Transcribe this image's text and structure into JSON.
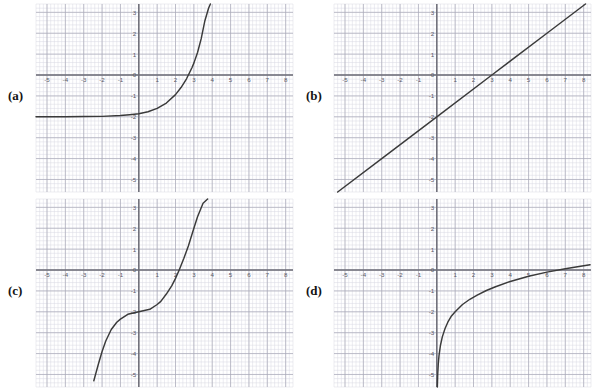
{
  "figure": {
    "background_color": "#ffffff",
    "width": 596,
    "height": 390,
    "grid_minor_color": "#d8d8e2",
    "grid_major_color": "#a9a9b8",
    "axis_color": "#6e6e78",
    "curve_color": "#3a3a3a",
    "label_color": "#141414"
  },
  "panels": [
    {
      "key": "a",
      "label": "(a)",
      "curve_type": "exponential",
      "description": "increasing exponential with horizontal asymptote y = -2, passing through (0,-2) region and crossing x-axis near x = 3"
    },
    {
      "key": "b",
      "label": "(b)",
      "curve_type": "line",
      "description": "straight line with y-intercept -2 and x-intercept 3, slope 2/3"
    },
    {
      "key": "c",
      "label": "(c)",
      "curve_type": "cubic",
      "description": "cubic with inflection point at (0,-2), flat near origin, crossing x-axis near x = 3"
    },
    {
      "key": "d",
      "label": "(d)",
      "curve_type": "logarithmic",
      "description": "logarithmic curve with vertical asymptote at x = 0, crossing x-axis near x = 2.7, reaching y = 1 near x = 8"
    }
  ],
  "axes": {
    "x_label_values": [
      "-5",
      "-4",
      "-3",
      "-2",
      "-1",
      "0",
      "1",
      "2",
      "3",
      "4",
      "5",
      "6",
      "7",
      "8"
    ],
    "y_label_values": [
      "3",
      "2",
      "1",
      "0",
      "-1",
      "-2",
      "-3",
      "-4",
      "-5"
    ],
    "x_min": -5.6,
    "x_max": 8.4,
    "y_min": -5.6,
    "y_max": 3.4,
    "minor_step": 0.2,
    "major_step": 1,
    "grid": true,
    "zero_label": "0"
  },
  "chart_data": [
    {
      "type": "line",
      "panel": "a",
      "title": "(a)",
      "xlabel": "",
      "ylabel": "",
      "xlim": [
        -5.6,
        8.4
      ],
      "ylim": [
        -5.6,
        3.4
      ],
      "grid": true,
      "legend": "none",
      "series": [
        {
          "name": "y = e^x - 2 (approx., shifted)",
          "x": [
            -5.6,
            -5.0,
            -4.0,
            -3.0,
            -2.0,
            -1.0,
            -0.5,
            0.0,
            0.5,
            1.0,
            1.5,
            2.0,
            2.3,
            2.6,
            2.9,
            3.0,
            3.2,
            3.4,
            3.6,
            3.8,
            3.9
          ],
          "y": [
            -2.0,
            -2.0,
            -2.0,
            -1.99,
            -1.98,
            -1.94,
            -1.9,
            -1.85,
            -1.76,
            -1.6,
            -1.34,
            -0.94,
            -0.6,
            -0.18,
            0.36,
            0.57,
            1.08,
            1.74,
            2.6,
            3.2,
            3.4
          ]
        }
      ]
    },
    {
      "type": "line",
      "panel": "b",
      "title": "(b)",
      "xlabel": "",
      "ylabel": "",
      "xlim": [
        -5.6,
        8.4
      ],
      "ylim": [
        -5.6,
        3.4
      ],
      "grid": true,
      "legend": "none",
      "series": [
        {
          "name": "y = (2/3)x - 2",
          "x": [
            -5.4,
            -3.0,
            0.0,
            3.0,
            6.0,
            8.1
          ],
          "y": [
            -5.6,
            -4.0,
            -2.0,
            0.0,
            2.0,
            3.4
          ]
        }
      ]
    },
    {
      "type": "line",
      "panel": "c",
      "title": "(c)",
      "xlabel": "",
      "ylabel": "",
      "xlim": [
        -5.6,
        8.4
      ],
      "ylim": [
        -5.6,
        3.4
      ],
      "grid": true,
      "legend": "none",
      "series": [
        {
          "name": "y = 0.2x^3 - 2 (approx. cubic, inflection at (0,-2))",
          "x": [
            -2.45,
            -2.2,
            -2.0,
            -1.8,
            -1.5,
            -1.2,
            -1.0,
            -0.6,
            0.0,
            0.6,
            1.0,
            1.2,
            1.5,
            1.8,
            2.0,
            2.2,
            2.45,
            2.7,
            3.0,
            3.2,
            3.5,
            3.75
          ],
          "y": [
            -5.3,
            -4.5,
            -3.9,
            -3.4,
            -2.85,
            -2.5,
            -2.35,
            -2.12,
            -2.0,
            -1.88,
            -1.65,
            -1.5,
            -1.15,
            -0.75,
            -0.4,
            0.0,
            0.55,
            1.15,
            2.0,
            2.55,
            3.2,
            3.4
          ]
        }
      ]
    },
    {
      "type": "line",
      "panel": "d",
      "title": "(d)",
      "xlabel": "",
      "ylabel": "",
      "xlim": [
        -5.6,
        8.4
      ],
      "ylim": [
        -5.6,
        3.4
      ],
      "grid": true,
      "legend": "none",
      "series": [
        {
          "name": "y = ln(x) - 1 (approx. log, vertical asymptote x = 0)",
          "x": [
            0.03,
            0.05,
            0.08,
            0.12,
            0.2,
            0.3,
            0.45,
            0.6,
            0.8,
            1.0,
            1.4,
            1.8,
            2.2,
            2.7,
            3.2,
            4.0,
            5.0,
            6.0,
            7.0,
            8.0,
            8.35
          ],
          "y": [
            -5.6,
            -5.0,
            -4.5,
            -4.1,
            -3.6,
            -3.2,
            -2.8,
            -2.5,
            -2.2,
            -2.0,
            -1.65,
            -1.4,
            -1.2,
            -0.98,
            -0.8,
            -0.55,
            -0.3,
            -0.1,
            0.06,
            0.2,
            0.25
          ]
        }
      ]
    }
  ]
}
